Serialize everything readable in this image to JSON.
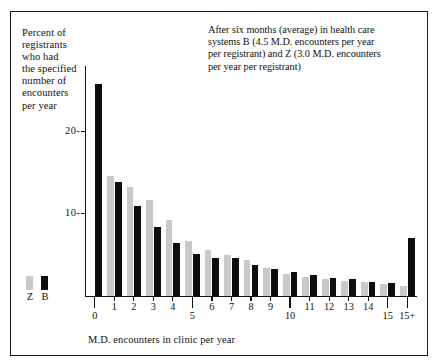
{
  "axis_label_y": "Percent of\nregistrants\nwho had\nthe specified\nnumber of\nencounters\nper year",
  "y_label_lines": [
    "Percent of",
    "registrants",
    "who had",
    "the specified",
    "number of",
    "encounters",
    "per year"
  ],
  "note_lines": [
    "After six months (average) in health care",
    "systems B (4.5 M.D. encounters per year",
    "per registrant) and Z (3.0 M.D. encounters",
    "per year per registrant)"
  ],
  "legend": {
    "items": [
      {
        "label": "Z",
        "color": "#c9c9c9"
      },
      {
        "label": "B",
        "color": "#0d0d0d"
      }
    ]
  },
  "colors": {
    "series_z": "#c9c9c9",
    "series_b": "#0d0d0d",
    "axis": "#111111",
    "frame": "#1a1a1a",
    "background": "#ffffff"
  },
  "chart_data": {
    "type": "bar",
    "title": "",
    "subtitle": "After six months (average) in health care systems B (4.5 M.D. encounters per year per registrant) and Z (3.0 M.D. encounters per year per registrant)",
    "xlabel": "M.D. encounters in clinic per year",
    "ylabel": "Percent of registrants who had the specified number of encounters per year",
    "categories": [
      "0",
      "1",
      "2",
      "3",
      "4",
      "5",
      "6",
      "7",
      "8",
      "9",
      "10",
      "11",
      "12",
      "13",
      "14",
      "15",
      "15+"
    ],
    "ylim": [
      0,
      28
    ],
    "yticks": [
      10,
      20
    ],
    "ytick_labels": [
      "10-",
      "20-"
    ],
    "grid": false,
    "legend_position": "bottom-left",
    "series": [
      {
        "name": "Z",
        "color": "#c9c9c9",
        "values": [
          0.0,
          14.6,
          13.2,
          11.6,
          9.2,
          6.6,
          5.6,
          5.0,
          4.4,
          3.4,
          2.6,
          2.3,
          2.0,
          1.8,
          1.6,
          1.4,
          1.2
        ]
      },
      {
        "name": "B",
        "color": "#0d0d0d",
        "values": [
          25.8,
          13.8,
          10.9,
          8.4,
          6.4,
          5.1,
          4.6,
          4.6,
          3.7,
          3.2,
          2.9,
          2.5,
          2.2,
          2.0,
          1.7,
          1.5,
          7.0
        ]
      }
    ]
  },
  "xtick_labels": [
    "0",
    "1",
    "2",
    "3",
    "4",
    "5",
    "6",
    "7",
    "8",
    "9",
    "10",
    "11",
    "12",
    "13",
    "14",
    "15",
    "15+"
  ],
  "xtick_label_rows": [
    1,
    0,
    0,
    0,
    0,
    1,
    0,
    0,
    0,
    0,
    1,
    0,
    0,
    0,
    0,
    1,
    1
  ],
  "xtitle": "M.D. encounters in clinic per year"
}
